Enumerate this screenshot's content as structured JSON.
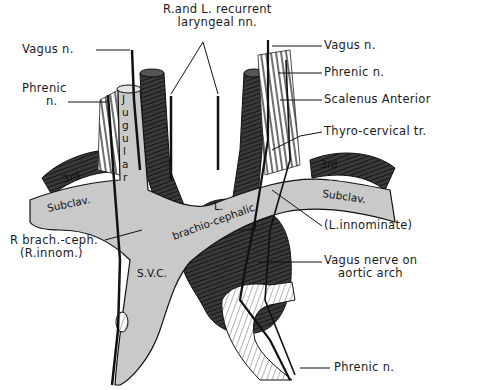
{
  "figure": {
    "colors": {
      "background": "#ffffff",
      "vein_fill": "#c9c9c9",
      "artery_fill": "#3a3a3a",
      "nerve_stroke": "#111111",
      "muscle_stripes": "#222222"
    }
  },
  "labels": {
    "recurrent_laryngeal_line1": "R.and L. recurrent",
    "recurrent_laryngeal_line2": "laryngeal nn.",
    "vagus_left": "Vagus n.",
    "phrenic_left_line1": "Phrenic",
    "phrenic_left_line2": "n.",
    "vagus_right": "Vagus n.",
    "phrenic_right": "Phrenic n.",
    "scalenus_anterior": "Scalenus Anterior",
    "thyro_cervical": "Thyro-cervical tr.",
    "r_brach_ceph_line1": "R brach.-ceph.",
    "r_brach_ceph_line2": "(R.innom.)",
    "l_innominate": "(L.innominate)",
    "vagus_aortic_line1": "Vagus nerve on",
    "vagus_aortic_line2": "aortic arch",
    "phrenic_bottom": "Phrenic n."
  },
  "vessel_text": {
    "jugular": [
      "J",
      "u",
      "g",
      "u",
      "l",
      "a",
      "r"
    ],
    "subclav_left": "Subclav.",
    "subclav_right": "Subclav.",
    "third_left": "3rd",
    "third_right": "3rd",
    "l_brachio_line1": "L.",
    "l_brachio_line2": "brachio-cephalic",
    "svc": "S.V.C."
  }
}
